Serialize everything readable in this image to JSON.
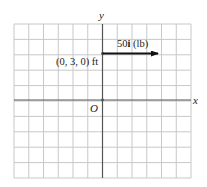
{
  "figure": {
    "type": "coordinate-grid-force-diagram",
    "grid": {
      "columns": 12,
      "rows": 10,
      "columns_left_of_y_axis": 6,
      "rows_above_x_axis": 5,
      "line_color": "#c8c8c8",
      "axis_color": "#555555"
    },
    "axes": {
      "x_label": "x",
      "y_label": "y",
      "origin_label": "O"
    },
    "force": {
      "label_magnitude": "50",
      "label_unit_vector": "i",
      "label_units": " (lb)",
      "start_point_label": "(0, 3, 0) ft",
      "start_y_units": 3,
      "length_grid_units": 4,
      "color": "#111111"
    }
  }
}
